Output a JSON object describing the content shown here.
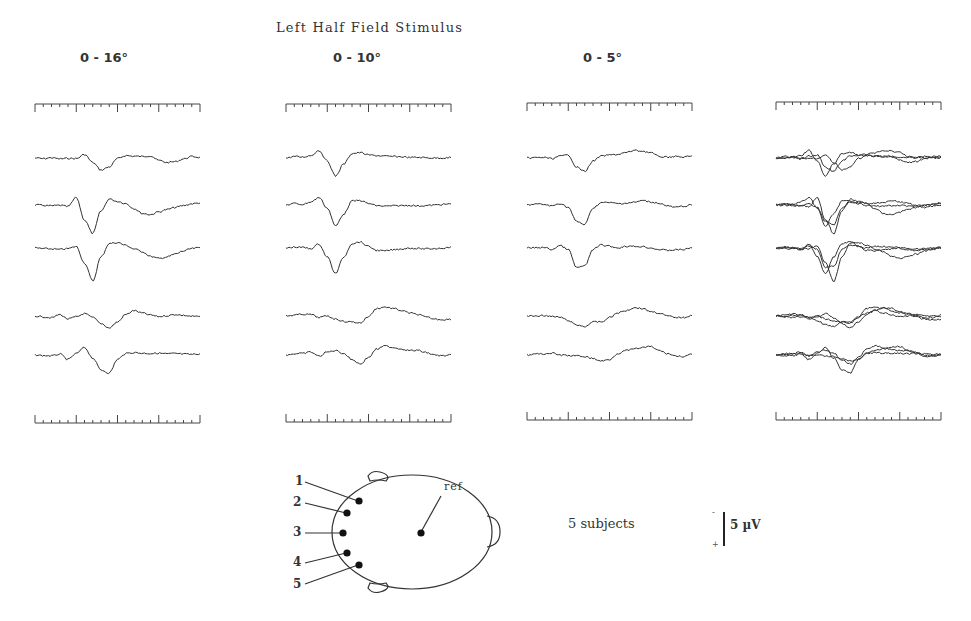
{
  "figure": {
    "title": "Left Half Field Stimulus",
    "columns": [
      {
        "label": "0 - 16°",
        "x": 35
      },
      {
        "label": "0 - 10°",
        "x": 286
      },
      {
        "label": "0 - 5°",
        "x": 527
      },
      {
        "label": "",
        "x": 776
      }
    ],
    "subjects_label": "5 subjects",
    "scale_bar": {
      "label": "5 µV",
      "minus": "-",
      "plus": "+"
    },
    "ref_label": "ref",
    "electrodes": [
      "1",
      "2",
      "3",
      "4",
      "5"
    ]
  },
  "chart_data": {
    "type": "line",
    "title": "Left Half Field Stimulus",
    "subtitle": "Visual evoked potentials, 5 subjects, electrodes 1-5 vs ref",
    "panels": [
      "0 - 16°",
      "0 - 10°",
      "0 - 5°",
      "overlay (all three)"
    ],
    "xlabel": "time (ticks)",
    "ylabel": "µV (negative up)",
    "scale": "5 µV",
    "x_ticks": 21,
    "major_tick_every": 5,
    "traces_per_panel": 5,
    "trace_baselines_px": [
      158,
      205,
      248,
      316,
      355
    ],
    "series": [
      {
        "name": "0-16 ch1",
        "values": [
          0,
          0.2,
          -0.1,
          0.3,
          0.1,
          0.2,
          -1.2,
          1.5,
          4.0,
          3.0,
          0.2,
          -0.8,
          -0.6,
          -0.5,
          -0.7,
          0.8,
          1.5,
          1.2,
          0.3,
          -0.5,
          -0.2
        ]
      },
      {
        "name": "0-16 ch2",
        "values": [
          0,
          0.1,
          0.3,
          0.1,
          0.5,
          -2.5,
          5,
          9.5,
          2,
          -2,
          -1.2,
          -0.5,
          1.2,
          2.8,
          3.2,
          2.3,
          1.5,
          0.8,
          0.2,
          -0.4,
          -0.7
        ]
      },
      {
        "name": "0-16 ch3",
        "values": [
          0,
          0.2,
          0.3,
          0.5,
          0.2,
          -0.5,
          5,
          11,
          3,
          -1.5,
          -1.8,
          -0.9,
          0.3,
          1.2,
          2.8,
          3.5,
          3,
          2,
          1,
          0.2,
          -0.1
        ]
      },
      {
        "name": "0-16 ch4",
        "values": [
          0,
          0.3,
          0.6,
          -0.5,
          1,
          0.3,
          -0.8,
          0.5,
          2.5,
          4,
          2,
          -0.5,
          -1.8,
          -1,
          -0.3,
          0.2,
          -0.1,
          -0.5,
          -0.2,
          0.1,
          0.2
        ]
      },
      {
        "name": "0-16 ch5",
        "values": [
          0,
          0.2,
          0.3,
          -0.3,
          1.5,
          -0.5,
          -2.5,
          1,
          5,
          6,
          1.5,
          -0.5,
          -0.8,
          -0.6,
          -0.5,
          -0.6,
          -0.4,
          -0.5,
          -0.3,
          -0.2,
          -0.4
        ]
      },
      {
        "name": "0-10 ch1",
        "values": [
          0,
          -0.5,
          -0.3,
          -0.8,
          -2.5,
          1,
          6,
          2,
          -1.5,
          -1.8,
          -1,
          -0.8,
          -0.6,
          -0.5,
          -0.4,
          -0.2,
          -0.2,
          -0.1,
          0,
          0,
          -0.1
        ]
      },
      {
        "name": "0-10 ch2",
        "values": [
          0,
          -0.5,
          -0.2,
          -1,
          -2.5,
          1,
          7,
          3,
          -1.3,
          -1.5,
          -0.5,
          0.2,
          0.4,
          0.3,
          0.2,
          0.1,
          0.3,
          0.2,
          0,
          -0.2,
          -0.3
        ]
      },
      {
        "name": "0-10 ch3",
        "values": [
          0,
          -0.3,
          -0.2,
          0.2,
          -1.3,
          3,
          8.5,
          3,
          -1.5,
          -2,
          -0.5,
          0.8,
          1,
          0.6,
          0.3,
          0,
          0.2,
          0.3,
          0.2,
          0,
          -0.3
        ]
      },
      {
        "name": "0-10 ch4",
        "values": [
          0,
          -0.3,
          -0.6,
          -0.5,
          0.5,
          0,
          1,
          1.8,
          2,
          2.3,
          0.2,
          -2.5,
          -3,
          -2.5,
          -1.8,
          -1,
          -0.5,
          0.4,
          1,
          1.2,
          1.1
        ]
      },
      {
        "name": "0-10 ch5",
        "values": [
          0,
          -0.4,
          -0.5,
          -1,
          0.4,
          -1,
          -1.5,
          -0.5,
          1.5,
          3,
          0.8,
          -2,
          -3,
          -2.5,
          -2,
          -1.5,
          -1.5,
          -0.8,
          0,
          0.3,
          0
        ]
      },
      {
        "name": "0-5 ch1",
        "values": [
          0,
          -0.1,
          -0.2,
          0.2,
          -0.6,
          -1,
          3,
          4.5,
          1,
          -0.6,
          -1,
          -1.2,
          -1.8,
          -2.5,
          -2.3,
          -1.8,
          -0.5,
          -0.3,
          -0.5,
          -0.3,
          -0.6
        ]
      },
      {
        "name": "0-5 ch2",
        "values": [
          0,
          -0.3,
          -0.2,
          0.3,
          -0.5,
          0.8,
          5.5,
          6.5,
          1,
          -0.8,
          -0.8,
          -0.5,
          -0.6,
          -0.9,
          -1.5,
          -1,
          -0.6,
          0.3,
          0.8,
          0.4,
          0
        ]
      },
      {
        "name": "0-5 ch3",
        "values": [
          0,
          -0.1,
          -0.2,
          0.5,
          -0.8,
          0.5,
          6.5,
          6,
          0.5,
          -1,
          -0.6,
          0,
          -0.6,
          -0.5,
          -0.5,
          0,
          0.5,
          0.8,
          0.6,
          0.5,
          -0.1
        ]
      },
      {
        "name": "0-5 ch4",
        "values": [
          0,
          0,
          -0.2,
          0.2,
          0.4,
          1.5,
          3,
          3.5,
          2,
          2,
          0.5,
          -1,
          -1.8,
          -2.8,
          -2.5,
          -1.5,
          -1,
          0,
          0.5,
          0.5,
          -0.3
        ]
      },
      {
        "name": "0-5 ch5",
        "values": [
          0,
          -0.3,
          -0.4,
          -0.6,
          0,
          0.2,
          0.3,
          0.5,
          1.2,
          2,
          1.5,
          -0.5,
          -1.5,
          -2,
          -2.5,
          -2.8,
          -1.5,
          -0.5,
          0.3,
          0.5,
          -0.2
        ]
      }
    ]
  }
}
